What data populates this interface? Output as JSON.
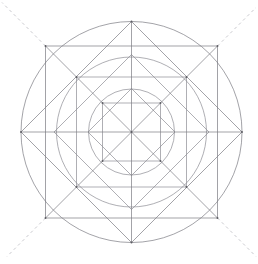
{
  "canvas": {
    "width": 258,
    "height": 264,
    "background": "#ffffff",
    "title": "Concentric squared-circle geometric construction"
  },
  "style": {
    "stroke_primary": "#7b7b82",
    "stroke_secondary": "#8d8d94",
    "stroke_faint": "#a9a9b0",
    "stroke_dashed": "#b3b3ba",
    "stroke_width_solid": 0.7,
    "stroke_width_dashed": 0.7,
    "dash_pattern": "3 3"
  },
  "geometry": {
    "center": {
      "x": 131.5,
      "y": 132.0
    },
    "circles": [
      {
        "name": "outer-circle",
        "radius": 110.5,
        "stroke": "#7b7b82"
      },
      {
        "name": "middle-circle",
        "radius": 75.0,
        "stroke": "#8d8d94"
      },
      {
        "name": "inner-circle",
        "radius": 43.0,
        "stroke": "#8d8d94"
      }
    ],
    "squares": [
      {
        "name": "outer-square",
        "half_side": 86.0,
        "rotation": 0,
        "stroke": "#7b7b82"
      },
      {
        "name": "middle-square",
        "half_side": 55.0,
        "rotation": 0,
        "stroke": "#8d8d94"
      },
      {
        "name": "inner-square",
        "half_side": 29.0,
        "rotation": 0,
        "stroke": "#8d8d94"
      }
    ],
    "diamonds": [
      {
        "name": "outer-diamond",
        "vertex_radius": 110.5,
        "rotation": 45,
        "stroke": "#7b7b82"
      },
      {
        "name": "middle-diamond",
        "vertex_radius": 77.5,
        "rotation": 45,
        "stroke": "#8d8d94"
      },
      {
        "name": "inner-diamond",
        "vertex_radius": 43.5,
        "rotation": 45,
        "stroke": "#8d8d94"
      }
    ],
    "axes": [
      {
        "name": "vertical-axis",
        "x1": 131.5,
        "y1": 21.5,
        "x2": 131.5,
        "y2": 242.5
      },
      {
        "name": "horizontal-axis",
        "x1": 21.0,
        "y1": 132.0,
        "x2": 242.0,
        "y2": 132.0
      }
    ],
    "diagonals": [
      {
        "name": "diagonal-nwse",
        "x1": 45.5,
        "y1": 46.0,
        "x2": 217.5,
        "y2": 218.0
      },
      {
        "name": "diagonal-nesw",
        "x1": 217.5,
        "y1": 46.0,
        "x2": 45.5,
        "y2": 218.0
      }
    ],
    "dashed_rays": [
      {
        "name": "dashed-ray-nw",
        "x1": 45.5,
        "y1": 46.0,
        "x2": 2.0,
        "y2": 2.5
      },
      {
        "name": "dashed-ray-ne",
        "x1": 217.5,
        "y1": 46.0,
        "x2": 256.0,
        "y2": 7.5
      },
      {
        "name": "dashed-ray-sw",
        "x1": 45.5,
        "y1": 218.0,
        "x2": 7.0,
        "y2": 256.5
      },
      {
        "name": "dashed-ray-se",
        "x1": 217.5,
        "y1": 218.0,
        "x2": 256.0,
        "y2": 256.5
      }
    ],
    "vertex_markers": [
      {
        "name": "marker-center",
        "x": 131.5,
        "y": 132.0
      },
      {
        "name": "marker-top",
        "x": 131.5,
        "y": 21.5
      },
      {
        "name": "marker-bottom",
        "x": 131.5,
        "y": 242.5
      },
      {
        "name": "marker-left",
        "x": 21.0,
        "y": 132.0
      },
      {
        "name": "marker-right",
        "x": 242.0,
        "y": 132.0
      },
      {
        "name": "marker-corner-nw",
        "x": 45.5,
        "y": 46.0
      },
      {
        "name": "marker-corner-ne",
        "x": 217.5,
        "y": 46.0
      },
      {
        "name": "marker-corner-sw",
        "x": 45.5,
        "y": 218.0
      },
      {
        "name": "marker-corner-se",
        "x": 217.5,
        "y": 218.0
      },
      {
        "name": "marker-mid-nw",
        "x": 76.5,
        "y": 77.0
      },
      {
        "name": "marker-mid-ne",
        "x": 186.5,
        "y": 77.0
      },
      {
        "name": "marker-mid-sw",
        "x": 76.5,
        "y": 187.0
      },
      {
        "name": "marker-mid-se",
        "x": 186.5,
        "y": 187.0
      },
      {
        "name": "marker-in-nw",
        "x": 102.5,
        "y": 103.0
      },
      {
        "name": "marker-in-ne",
        "x": 160.5,
        "y": 103.0
      },
      {
        "name": "marker-in-sw",
        "x": 102.5,
        "y": 161.0
      },
      {
        "name": "marker-in-se",
        "x": 160.5,
        "y": 161.0
      }
    ]
  }
}
